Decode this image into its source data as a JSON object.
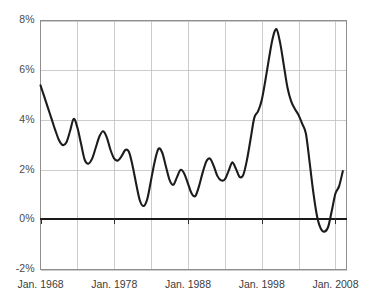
{
  "chart_data": {
    "type": "line",
    "title": "",
    "subtitle": "",
    "xlabel": "",
    "ylabel": "",
    "grid": true,
    "legend": false,
    "legend_position": "none",
    "line_color": "#1c1c1c",
    "grid_color": "#bfbfbf",
    "zero_line_color": "#1a1a1a",
    "ylim": [
      -2,
      8
    ],
    "ytick_labels": [
      "8%",
      "6%",
      "4%",
      "2%",
      "0%",
      "-2%"
    ],
    "ytick_values": [
      8,
      6,
      4,
      2,
      0,
      -2
    ],
    "xlim": [
      1968,
      2009.5
    ],
    "xtick_labels": [
      "Jan. 1968",
      "Jan. 1978",
      "Jan. 1988",
      "Jan. 1998",
      "Jan. 2008"
    ],
    "xtick_values": [
      1968,
      1978,
      1988,
      1998,
      2008
    ],
    "x_minor_gridline_values": [
      1968,
      1973,
      1978,
      1983,
      1988,
      1993,
      1998,
      2003,
      2008
    ],
    "x": [
      1968.0,
      1968.5,
      1969.0,
      1969.5,
      1970.0,
      1970.5,
      1971.0,
      1971.5,
      1972.0,
      1972.5,
      1973.0,
      1973.5,
      1974.0,
      1974.5,
      1975.0,
      1975.5,
      1976.0,
      1976.5,
      1977.0,
      1977.5,
      1978.0,
      1978.5,
      1979.0,
      1979.5,
      1980.0,
      1980.5,
      1981.0,
      1981.5,
      1982.0,
      1982.5,
      1983.0,
      1983.5,
      1984.0,
      1984.5,
      1985.0,
      1985.5,
      1986.0,
      1986.5,
      1987.0,
      1987.5,
      1988.0,
      1988.5,
      1989.0,
      1989.5,
      1990.0,
      1990.5,
      1991.0,
      1991.5,
      1992.0,
      1992.5,
      1993.0,
      1993.5,
      1994.0,
      1994.5,
      1995.0,
      1995.5,
      1996.0,
      1996.5,
      1997.0,
      1997.5,
      1998.0,
      1998.5,
      1999.0,
      1999.5,
      2000.0,
      2000.5,
      2001.0,
      2001.5,
      2002.0,
      2002.5,
      2003.0,
      2003.5,
      2004.0,
      2004.5,
      2005.0,
      2005.5,
      2006.0,
      2006.5,
      2007.0,
      2007.5,
      2008.0,
      2008.5,
      2009.0
    ],
    "values": [
      5.4,
      4.95,
      4.5,
      4.05,
      3.6,
      3.2,
      3.0,
      3.1,
      3.55,
      4.05,
      3.7,
      3.05,
      2.4,
      2.25,
      2.45,
      2.9,
      3.35,
      3.55,
      3.3,
      2.8,
      2.45,
      2.38,
      2.55,
      2.8,
      2.72,
      2.15,
      1.4,
      0.75,
      0.55,
      0.85,
      1.6,
      2.35,
      2.85,
      2.7,
      2.15,
      1.6,
      1.4,
      1.7,
      2.0,
      1.85,
      1.45,
      1.05,
      0.95,
      1.35,
      1.9,
      2.35,
      2.45,
      2.15,
      1.75,
      1.58,
      1.62,
      1.95,
      2.3,
      2.05,
      1.72,
      1.8,
      2.4,
      3.25,
      4.1,
      4.35,
      4.8,
      5.6,
      6.5,
      7.3,
      7.65,
      7.1,
      6.2,
      5.3,
      4.75,
      4.45,
      4.2,
      3.85,
      3.45,
      2.3,
      1.1,
      0.15,
      -0.35,
      -0.48,
      -0.3,
      0.35,
      1.05,
      1.35,
      1.95
    ]
  }
}
